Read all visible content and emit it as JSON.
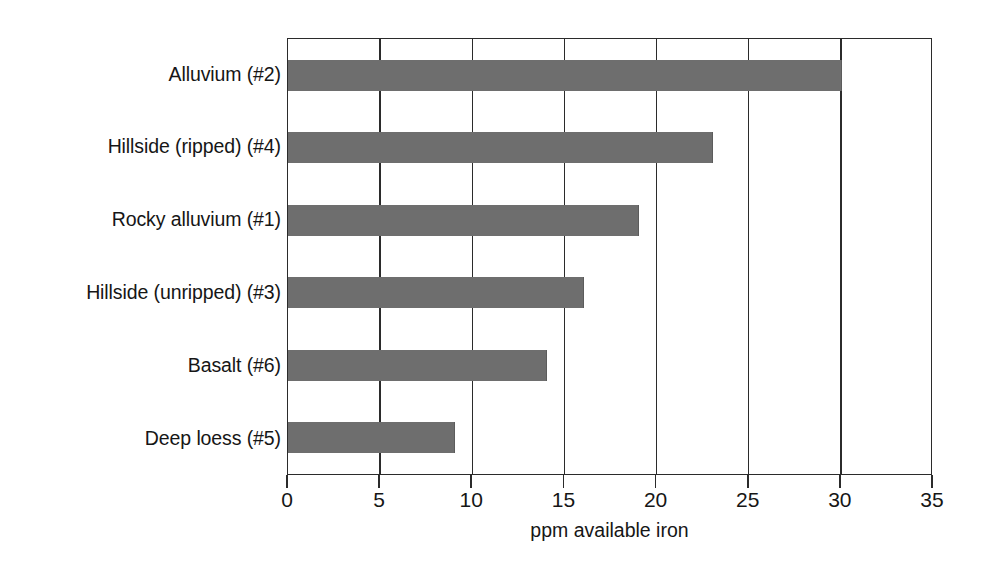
{
  "chart_data": {
    "type": "bar",
    "orientation": "horizontal",
    "title": "",
    "xlabel": "ppm available iron",
    "ylabel": "",
    "categories": [
      "Alluvium (#2)",
      "Hillside (ripped) (#4)",
      "Rocky alluvium (#1)",
      "Hillside (unripped) (#3)",
      "Basalt (#6)",
      "Deep loess (#5)"
    ],
    "values": [
      30,
      23,
      19,
      16,
      14,
      9
    ],
    "xlim": [
      0,
      35
    ],
    "xticks": [
      0,
      5,
      10,
      15,
      20,
      25,
      30,
      35
    ],
    "xticklabels": [
      "0",
      "5",
      "10",
      "15",
      "20",
      "25",
      "30",
      "35"
    ],
    "grid": "vertical",
    "legend": "none",
    "bar_color": "#6e6e6e",
    "axis_color": "#2b2b2b",
    "background_color": "#ffffff"
  }
}
